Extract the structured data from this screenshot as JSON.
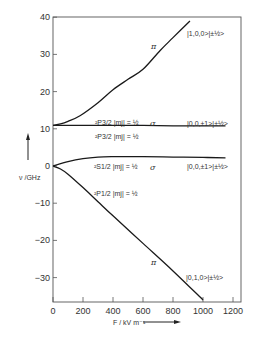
{
  "chart_data": {
    "type": "line",
    "title": "",
    "xlabel": "F / kV m⁻¹",
    "ylabel": "ν / GHz",
    "xlim": [
      0,
      1250
    ],
    "ylim": [
      -36,
      40
    ],
    "x_ticks": [
      0,
      200,
      400,
      600,
      800,
      1000,
      1200
    ],
    "y_ticks": [
      -30,
      -20,
      -10,
      0,
      10,
      20,
      30,
      40
    ],
    "grid": false,
    "series": [
      {
        "name": "|1,0,0>|±½>",
        "polarization": "π",
        "level": "²P3/2 |mj| = ½",
        "x": [
          0,
          50,
          100,
          180,
          300,
          400,
          500,
          600,
          713,
          800,
          913
        ],
        "values": [
          10.9,
          11.3,
          12.0,
          13.5,
          17.0,
          20.5,
          23.3,
          26.0,
          31.0,
          34.5,
          39.0
        ]
      },
      {
        "name": "|0,0,±1>|±½>",
        "polarization": "σ",
        "level": "²P3/2 |mj| = ½",
        "x": [
          0,
          200,
          400,
          600,
          800,
          1000,
          1150
        ],
        "values": [
          10.9,
          10.9,
          10.9,
          10.9,
          10.8,
          10.8,
          10.8
        ]
      },
      {
        "name": "|0,0,±1>|±½>",
        "polarization": "σ",
        "level": "²S1/2 |mj| = ½",
        "x": [
          0,
          100,
          200,
          300,
          400,
          600,
          800,
          1000,
          1150
        ],
        "values": [
          0,
          1.2,
          2.0,
          2.4,
          2.5,
          2.5,
          2.4,
          2.3,
          2.2
        ]
      },
      {
        "name": "|0,1,0>|±½>",
        "polarization": "π",
        "level": "²P1/2 |mj| = ½",
        "x": [
          0,
          50,
          100,
          200,
          300,
          400,
          600,
          800,
          1000
        ],
        "values": [
          0,
          -0.8,
          -2.2,
          -5.8,
          -9.6,
          -13.4,
          -20.8,
          -28.2,
          -36.0
        ]
      }
    ],
    "annotations": [
      {
        "text": "²P3/2 |mj| = ½",
        "position": "above line at 10.9"
      },
      {
        "text": "²P3/2 |mj| = ½",
        "position": "below line at 10.9"
      },
      {
        "text": "²S1/2 |mj| = ½",
        "position": "below line near 0"
      },
      {
        "text": "²P1/2 |mj| = ½",
        "position": "below lower curve"
      },
      {
        "text": "π",
        "position": "upper curve"
      },
      {
        "text": "σ",
        "position": "line at 10.9"
      },
      {
        "text": "σ",
        "position": "line near 2.5"
      },
      {
        "text": "π",
        "position": "lower curve"
      }
    ],
    "legend": "inline labels at right"
  },
  "labels": {
    "y_axis": "ν /GHz",
    "x_axis": "F / kV m⁻¹",
    "state_pi_upper": "|1,0,0>|±½>",
    "state_sigma_p32": "|0,0,±1>|±½>",
    "state_sigma_s12": "|0,0,±1>|±½>",
    "state_pi_lower": "|0,1,0>|±½>",
    "p32_above": "²P3/2 |mj| = ½",
    "p32_below": "²P3/2 |mj| = ½",
    "s12": "²S1/2 |mj| = ½",
    "p12": "²P1/2 |mj| = ½",
    "pi": "π",
    "sigma": "σ"
  }
}
